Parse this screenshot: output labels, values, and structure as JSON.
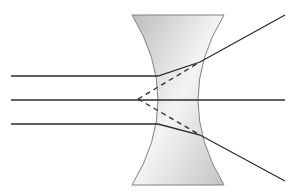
{
  "diagram": {
    "lens": {
      "type": "biconcave",
      "top_y": 15,
      "bottom_y": 185,
      "top_left_x": 132,
      "top_right_x": 224,
      "waist_left_x": 158,
      "waist_right_x": 198,
      "fill_light": "#f2f2f2",
      "fill_dark": "#bdbdbd",
      "stroke": "#808080"
    },
    "rays": [
      {
        "name": "upper-ray",
        "points": [
          [
            11,
            76
          ],
          [
            158,
            76
          ],
          [
            200,
            62
          ],
          [
            285,
            15
          ]
        ]
      },
      {
        "name": "axial-ray",
        "points": [
          [
            11,
            100
          ],
          [
            285,
            100
          ]
        ]
      },
      {
        "name": "lower-ray",
        "points": [
          [
            11,
            124
          ],
          [
            158,
            124
          ],
          [
            200,
            135
          ],
          [
            285,
            181
          ]
        ]
      }
    ],
    "virtual_rays": [
      {
        "name": "upper-virtual-ray",
        "from": [
          138,
          99
        ],
        "to": [
          200,
          62
        ]
      },
      {
        "name": "lower-virtual-ray",
        "from": [
          138,
          99
        ],
        "to": [
          200,
          135
        ]
      }
    ],
    "virtual_focus": [
      138,
      99
    ],
    "ray_color": "#2b2b2b"
  }
}
